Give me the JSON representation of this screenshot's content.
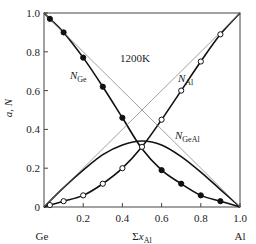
{
  "chart_data": {
    "type": "line",
    "title": "",
    "annotation": "1200K",
    "xlabel": "Σx_Al",
    "ylabel": "a, N",
    "xlim": [
      0,
      1.0
    ],
    "ylim": [
      0,
      1.0
    ],
    "x_ticks": [
      "0.2",
      "0.4",
      "0.6",
      "0.8",
      "1.0"
    ],
    "y_ticks": [
      "0",
      "0.2",
      "0.4",
      "0.6",
      "0.8",
      "1.0"
    ],
    "x_end_labels": {
      "left": "Ge",
      "right": "Al"
    },
    "grid": false,
    "series": [
      {
        "name": "N_Ge",
        "label_main": "N",
        "label_sub": "Ge",
        "style": "solid-thick",
        "markers": "filled",
        "x": [
          0,
          0.03,
          0.1,
          0.2,
          0.3,
          0.4,
          0.5,
          0.6,
          0.7,
          0.8,
          0.9,
          1.0
        ],
        "y": [
          1.0,
          0.97,
          0.9,
          0.77,
          0.62,
          0.46,
          0.3,
          0.19,
          0.12,
          0.06,
          0.03,
          0
        ],
        "points_x": [
          0.03,
          0.1,
          0.2,
          0.3,
          0.4,
          0.6,
          0.7,
          0.8,
          0.9
        ],
        "points_y": [
          0.97,
          0.9,
          0.77,
          0.62,
          0.46,
          0.19,
          0.12,
          0.06,
          0.03
        ]
      },
      {
        "name": "N_Al",
        "label_main": "N",
        "label_sub": "Al",
        "style": "solid-thick",
        "markers": "open",
        "x": [
          0,
          0.03,
          0.1,
          0.2,
          0.3,
          0.4,
          0.5,
          0.6,
          0.7,
          0.8,
          0.9,
          1.0
        ],
        "y": [
          0,
          0.01,
          0.03,
          0.06,
          0.12,
          0.2,
          0.31,
          0.45,
          0.6,
          0.75,
          0.89,
          1.0
        ],
        "points_x": [
          0.03,
          0.1,
          0.2,
          0.3,
          0.4,
          0.5,
          0.6,
          0.7,
          0.8,
          0.9
        ],
        "points_y": [
          0.01,
          0.03,
          0.06,
          0.12,
          0.2,
          0.31,
          0.45,
          0.6,
          0.75,
          0.89
        ]
      },
      {
        "name": "N_GeAl",
        "label_main": "N",
        "label_sub": "GeAl",
        "style": "solid-thick",
        "markers": "none",
        "x": [
          0,
          0.1,
          0.2,
          0.3,
          0.4,
          0.5,
          0.6,
          0.7,
          0.8,
          0.9,
          1.0
        ],
        "y": [
          0,
          0.1,
          0.19,
          0.27,
          0.32,
          0.34,
          0.32,
          0.26,
          0.18,
          0.09,
          0
        ]
      },
      {
        "name": "ideal_Ge",
        "style": "thin-dotted",
        "x": [
          0,
          1.0
        ],
        "y": [
          1.0,
          0
        ]
      },
      {
        "name": "ideal_Al",
        "style": "thin-dotted",
        "x": [
          0,
          1.0
        ],
        "y": [
          0,
          1.0
        ]
      }
    ]
  }
}
